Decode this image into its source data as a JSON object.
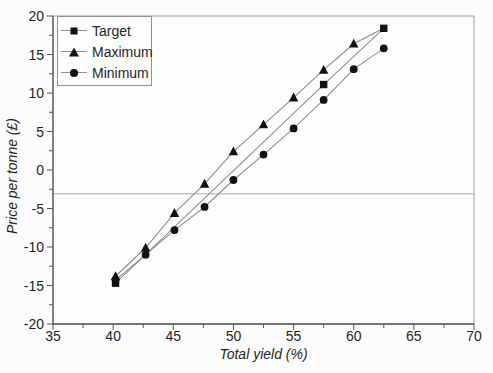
{
  "figure": {
    "width": 493,
    "height": 373,
    "background": "#fcfcfc"
  },
  "chart_data": {
    "type": "line",
    "title": "",
    "xlabel": "Total yield (%)",
    "ylabel": "Price per tonne (£)",
    "xlim": [
      35,
      70
    ],
    "ylim": [
      -20,
      20
    ],
    "x_major_ticks": [
      35,
      40,
      45,
      50,
      55,
      60,
      65,
      70
    ],
    "x_minor_step": 2.5,
    "y_major_ticks": [
      20,
      15,
      10,
      5,
      0,
      -5,
      -10,
      -15,
      -20
    ],
    "y_minor_step": 2.5,
    "grid": false,
    "reference_line_y": -3.1,
    "legend": {
      "position": "top-left",
      "entries": [
        {
          "label": "Target",
          "marker": "square"
        },
        {
          "label": "Maximum",
          "marker": "triangle"
        },
        {
          "label": "Minimum",
          "marker": "circle"
        }
      ]
    },
    "series": [
      {
        "name": "Target",
        "marker": "square",
        "x": [
          40.2,
          57.5,
          62.5
        ],
        "y": [
          -14.7,
          11.1,
          18.4
        ]
      },
      {
        "name": "Maximum",
        "marker": "triangle",
        "x": [
          40.2,
          42.7,
          45.1,
          47.6,
          50.0,
          52.5,
          55.0,
          57.5,
          60.0
        ],
        "y": [
          -13.8,
          -10.1,
          -5.6,
          -1.8,
          2.4,
          5.9,
          9.4,
          13.0,
          16.4
        ],
        "line_endpoint": {
          "x": 62.5,
          "y": 18.4
        }
      },
      {
        "name": "Minimum",
        "marker": "circle",
        "x": [
          40.2,
          42.7,
          45.1,
          47.6,
          50.0,
          52.5,
          55.0,
          57.5,
          60.0,
          62.5
        ],
        "y": [
          -14.3,
          -11.0,
          -7.8,
          -4.8,
          -1.3,
          2.0,
          5.4,
          9.1,
          13.1,
          15.8
        ]
      }
    ],
    "colors": {
      "marker": "#111111",
      "line": "#8f8f8f",
      "axis": "#555555",
      "box": "#a0a0a0",
      "text": "#1f1f1f",
      "reference_line": "#ababab",
      "legend_border": "#8f8f8f",
      "plot_background": "#fdfdfd"
    }
  }
}
